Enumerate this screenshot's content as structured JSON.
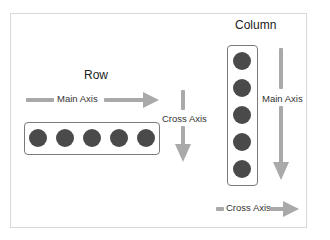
{
  "diagram": {
    "row": {
      "title": "Row",
      "main_axis_label": "Main Axis",
      "cross_axis_label": "Cross Axis",
      "item_count": 5
    },
    "column": {
      "title": "Column",
      "main_axis_label": "Main Axis",
      "cross_axis_label": "Cross Axis",
      "item_count": 5
    },
    "colors": {
      "arrow": "#a9a9a9",
      "dot": "#4a4a4a",
      "box_border": "#7a7a7a",
      "frame_border": "#d8d8d8"
    }
  }
}
